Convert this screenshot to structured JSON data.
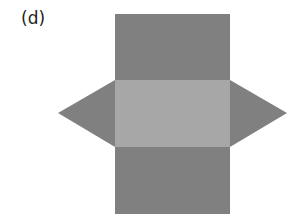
{
  "figure": {
    "label": "(d)",
    "colors": {
      "face_dark": "#808080",
      "face_light": "#a7a7a7",
      "background": "#ffffff"
    },
    "faces": [
      {
        "name": "top-rectangle",
        "shape": "rectangle",
        "x": 115,
        "y": 14,
        "w": 115,
        "h": 66,
        "fill": "dark"
      },
      {
        "name": "middle-rectangle",
        "shape": "rectangle",
        "x": 115,
        "y": 80,
        "w": 115,
        "h": 67,
        "fill": "light"
      },
      {
        "name": "bottom-rectangle",
        "shape": "rectangle",
        "x": 115,
        "y": 147,
        "w": 115,
        "h": 67,
        "fill": "dark"
      },
      {
        "name": "left-triangle",
        "shape": "triangle",
        "points": [
          [
            115,
            80
          ],
          [
            58,
            113
          ],
          [
            115,
            147
          ]
        ],
        "fill": "dark"
      },
      {
        "name": "right-triangle",
        "shape": "triangle",
        "points": [
          [
            230,
            80
          ],
          [
            287,
            113
          ],
          [
            230,
            147
          ]
        ],
        "fill": "dark"
      }
    ]
  }
}
